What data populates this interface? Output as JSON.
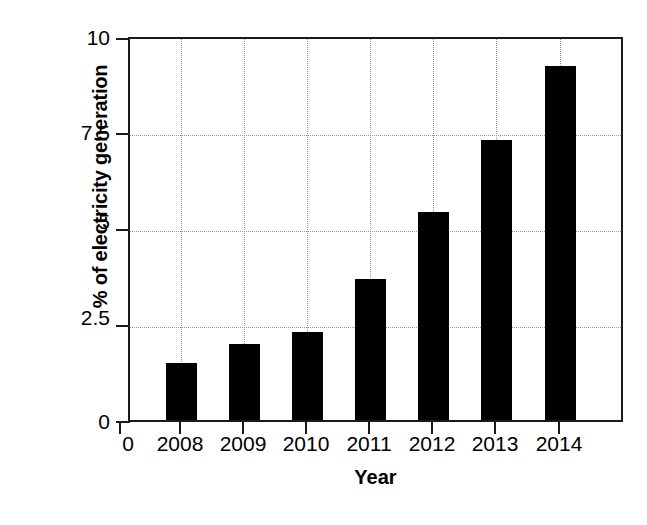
{
  "chart_data": {
    "type": "bar",
    "title": "",
    "subtitle": "",
    "xlabel": "Year",
    "ylabel": "% of electricity generation",
    "categories": [
      "2008",
      "2009",
      "2010",
      "2011",
      "2012",
      "2013",
      "2014"
    ],
    "values": [
      1.5,
      2.0,
      2.3,
      3.7,
      5.45,
      7.35,
      9.3
    ],
    "series": [
      {
        "name": "% of electricity generation",
        "values": [
          1.5,
          2.0,
          2.3,
          3.7,
          5.45,
          7.35,
          9.3
        ]
      }
    ],
    "ylim": [
      0,
      10
    ],
    "ytick_labels": [
      "0",
      "2.5",
      "5",
      "7.5",
      "10"
    ],
    "ytick_values": [
      0,
      2.5,
      5,
      7.5,
      10
    ],
    "xtick_labels": [
      "2008",
      "2009",
      "2010",
      "2011",
      "2012",
      "2013",
      "2014"
    ],
    "x_origin_label": "0",
    "grid": true,
    "grid_style": "dotted",
    "legend": null,
    "legend_position": "none",
    "bar_color": "#000000",
    "axis_color": "#1a1a1a",
    "grid_color": "#9a9a9a",
    "background": "#ffffff",
    "annotations": []
  },
  "axes": {
    "y_title": "% of electricity generation",
    "x_title": "Year",
    "x_origin_label": "0"
  }
}
